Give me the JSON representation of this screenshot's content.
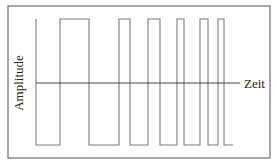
{
  "diagram": {
    "type": "fm-square-wave",
    "y_label": "Amplitude",
    "x_label": "Zeit",
    "colors": {
      "frame": "#6b6b6b",
      "wave": "#7a7a7a",
      "axis": "#444444",
      "text": "#222222"
    },
    "frame": {
      "x": 8,
      "y": 6,
      "w": 262,
      "h": 152
    },
    "axis_y": 83,
    "axis_x_start": 36,
    "axis_x_end": 240,
    "high_y": 19,
    "low_y": 145,
    "edges_x": [
      36,
      60,
      89,
      119,
      130,
      148,
      160,
      177,
      184,
      200,
      208,
      218,
      224,
      233
    ]
  }
}
